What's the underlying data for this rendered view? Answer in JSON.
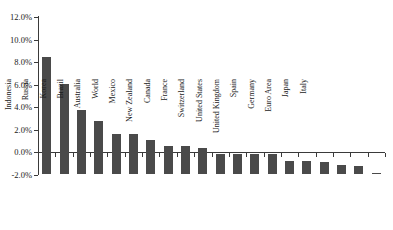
{
  "chart_data": {
    "type": "bar",
    "title": "",
    "xlabel": "",
    "ylabel": "",
    "ylim": [
      -2.0,
      12.0
    ],
    "ytick_step": 2.0,
    "ytick_labels": [
      "12.0%",
      "10.0%",
      "8.0%",
      "6.0%",
      "4.0%",
      "2.0%",
      "0.0%",
      "-2.0%"
    ],
    "ytick_values": [
      12.0,
      10.0,
      8.0,
      6.0,
      4.0,
      2.0,
      0.0,
      -2.0
    ],
    "grid": false,
    "legend": "none",
    "bar_color": "#4a4a4a",
    "axis_color": "#3a3a3a",
    "categories": [
      "China",
      "India",
      "Indonesia",
      "Russia",
      "Korea",
      "Brazil",
      "Australia",
      "World",
      "Mexico",
      "New Zealand",
      "Canada",
      "France",
      "Switzerland",
      "United States",
      "United Kingdom",
      "Spain",
      "Germany",
      "Euro Area",
      "Japan",
      "Italy"
    ],
    "values": [
      10.4,
      8.0,
      5.7,
      4.7,
      3.6,
      3.6,
      3.0,
      2.5,
      2.5,
      2.3,
      1.8,
      1.8,
      1.8,
      1.75,
      1.2,
      1.2,
      1.1,
      0.8,
      0.7,
      0.05
    ]
  }
}
